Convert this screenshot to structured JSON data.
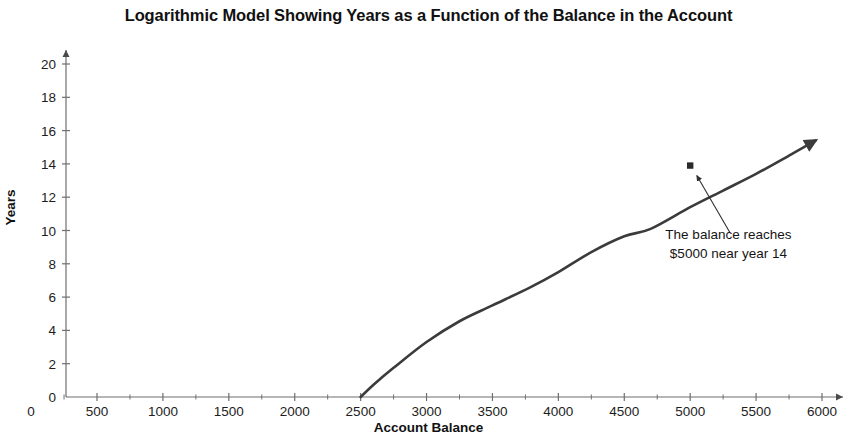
{
  "chart_data": {
    "type": "line",
    "title": "Logarithmic Model Showing Years as a Function of the Balance in the Account",
    "xlabel": "Account Balance",
    "ylabel": "Years",
    "xlim": [
      0,
      6000
    ],
    "ylim": [
      0,
      20
    ],
    "x_ticks": [
      0,
      500,
      1000,
      1500,
      2000,
      2500,
      3000,
      3500,
      4000,
      4500,
      5000,
      5500,
      6000
    ],
    "x_tick_labels": [
      "0",
      "500",
      "1000",
      "1500",
      "2000",
      "2500",
      "3000",
      "3500",
      "4000",
      "4500",
      "5000",
      "5500",
      "6000"
    ],
    "x_minor_step": 250,
    "y_ticks": [
      0,
      2,
      4,
      6,
      8,
      10,
      12,
      14,
      16,
      18,
      20
    ],
    "y_tick_labels": [
      "0",
      "2",
      "4",
      "6",
      "8",
      "10",
      "12",
      "14",
      "16",
      "18",
      "20"
    ],
    "grid": false,
    "legend": false,
    "axes_have_arrowheads": true,
    "series": [
      {
        "name": "Years as a function of balance",
        "color": "#3b3b3b",
        "line_width": 2.6,
        "has_end_arrow": true,
        "x": [
          2500,
          2600,
          2750,
          3000,
          3250,
          3500,
          3790,
          4000,
          4250,
          4500,
          4700,
          5000,
          5250,
          5500,
          5750,
          5950
        ],
        "y": [
          0.0,
          0.75,
          1.75,
          3.3,
          4.55,
          5.5,
          6.6,
          7.5,
          8.7,
          9.65,
          10.1,
          11.4,
          12.4,
          13.4,
          14.5,
          15.4
        ]
      }
    ],
    "points": [
      {
        "label": "balance-5000-marker",
        "x": 5000,
        "y": 13.9,
        "marker": "square-dot",
        "color": "#2a2a2a"
      }
    ],
    "annotations": [
      {
        "name": "balance-5000-annotation",
        "lines": [
          "The balance reaches",
          "$5000 near year 14"
        ],
        "text_x": 5290,
        "text_y": 9.5,
        "arrow_from": {
          "x": 5300,
          "y": 9.9
        },
        "arrow_to": {
          "x": 5050,
          "y": 13.3
        }
      }
    ]
  },
  "colors": {
    "background": "#ffffff",
    "axis": "#6f6f6f",
    "curve": "#3b3b3b",
    "text": "#111111"
  }
}
